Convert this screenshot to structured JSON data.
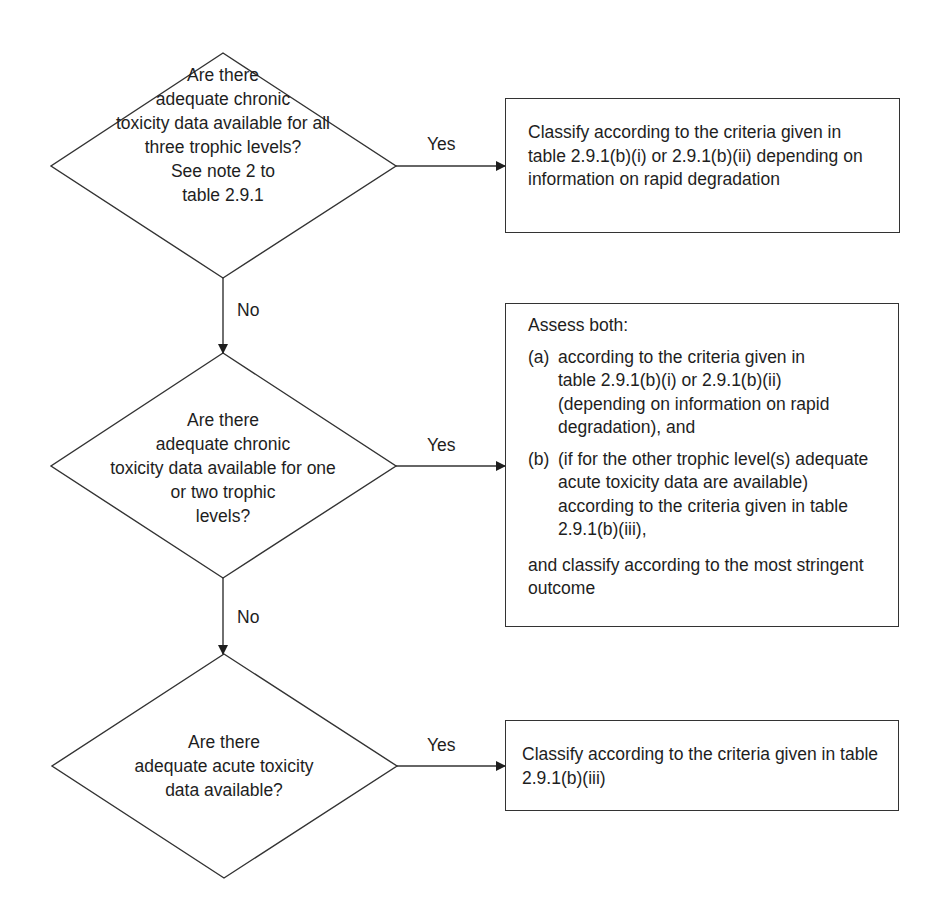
{
  "flowchart": {
    "decisions": [
      {
        "id": "d1",
        "text_lines": [
          "Are there",
          "adequate chronic",
          "toxicity data available for all",
          "three trophic levels?",
          "See note 2 to",
          "table 2.9.1"
        ]
      },
      {
        "id": "d2",
        "text_lines": [
          "Are there",
          "adequate chronic",
          "toxicity data available for one",
          "or two trophic",
          "levels?"
        ]
      },
      {
        "id": "d3",
        "text_lines": [
          "Are there",
          "adequate acute toxicity",
          "data available?"
        ]
      }
    ],
    "edge_labels": {
      "yes1": "Yes",
      "yes2": "Yes",
      "yes3": "Yes",
      "no1": "No",
      "no2": "No"
    },
    "outcomes": {
      "box1": {
        "text": "Classify according to the criteria given in table 2.9.1(b)(i) or 2.9.1(b)(ii) depending on information on rapid degradation"
      },
      "box2": {
        "intro": "Assess both:",
        "items": [
          {
            "marker": "(a)",
            "text": "according to the criteria given in table 2.9.1(b)(i) or 2.9.1(b)(ii) (depending on information on rapid degradation), and"
          },
          {
            "marker": "(b)",
            "text": "(if for the other trophic level(s) adequate acute toxicity data are available) according to the criteria given in table 2.9.1(b)(iii),"
          }
        ],
        "outro": "and classify according to the most stringent outcome"
      },
      "box3": {
        "text": "Classify according to the criteria given in table 2.9.1(b)(iii)"
      }
    }
  }
}
